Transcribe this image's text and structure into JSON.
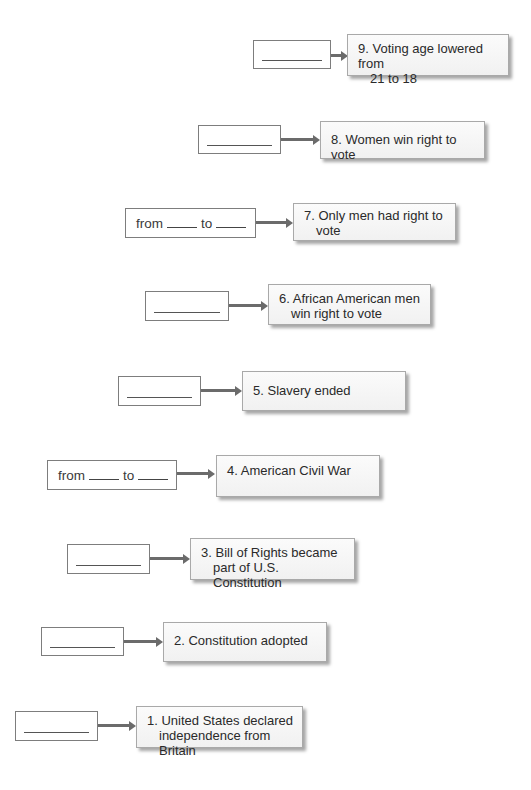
{
  "diagram": {
    "title": "",
    "range_from_label": "from",
    "range_to_label": "to",
    "blank_placeholder": "________",
    "colors": {
      "box_border": "#7d7d7d",
      "arrow": "#6b6b6b",
      "event_bg": "#f5f5f5",
      "text": "#2a2a2a"
    },
    "events": [
      {
        "number": "9.",
        "line1": "Voting age lowered from",
        "line2": "21 to 18",
        "answer_type": "blank"
      },
      {
        "number": "8.",
        "line1": "Women win right to vote",
        "line2": "",
        "answer_type": "blank"
      },
      {
        "number": "7.",
        "line1": "Only men had right to",
        "line2": "vote",
        "answer_type": "range"
      },
      {
        "number": "6.",
        "line1": "African American men",
        "line2": "win right to vote",
        "answer_type": "blank"
      },
      {
        "number": "5.",
        "line1": "Slavery ended",
        "line2": "",
        "answer_type": "blank"
      },
      {
        "number": "4.",
        "line1": "American Civil War",
        "line2": "",
        "answer_type": "range"
      },
      {
        "number": "3.",
        "line1": "Bill of Rights became",
        "line2": "part of U.S. Constitution",
        "answer_type": "blank"
      },
      {
        "number": "2.",
        "line1": "Constitution adopted",
        "line2": "",
        "answer_type": "blank"
      },
      {
        "number": "1.",
        "line1": "United States declared",
        "line2": "independence from Britain",
        "answer_type": "blank"
      }
    ]
  }
}
